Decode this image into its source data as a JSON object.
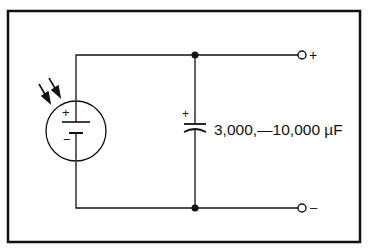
{
  "diagram": {
    "type": "circuit-schematic",
    "components": {
      "source": {
        "kind": "photovoltaic-cell",
        "icon": "solar-cell-icon",
        "plus_label": "+",
        "minus_label": "−",
        "light_arrows": 2
      },
      "capacitor": {
        "kind": "polarized-capacitor",
        "icon": "capacitor-icon",
        "plus_label": "+",
        "value_label": "3,000,—10,000 µF"
      }
    },
    "terminals": {
      "positive": {
        "label": "+"
      },
      "negative": {
        "label": "–"
      }
    },
    "colors": {
      "line": "#111111",
      "background": "#ffffff"
    }
  }
}
